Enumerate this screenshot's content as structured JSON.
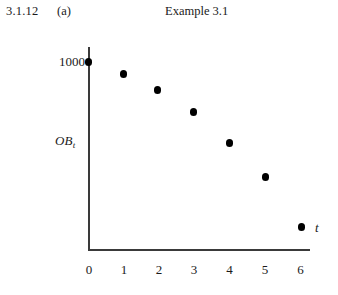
{
  "header": {
    "figure_number": "3.1.12",
    "figure_part": "(a)",
    "title": "Example 3.1"
  },
  "chart_data": {
    "type": "scatter",
    "title": "Example 3.1",
    "xlabel": "t",
    "ylabel": "OB_t",
    "ylabel_base": "OB",
    "ylabel_sub": "t",
    "x": [
      0,
      1,
      2,
      3,
      4,
      5,
      6
    ],
    "values": [
      1000,
      936,
      851,
      734,
      569,
      388,
      122
    ],
    "xtick_labels": [
      "0",
      "1",
      "2",
      "3",
      "4",
      "5",
      "6"
    ],
    "ytick_labels": [
      "1000"
    ],
    "ytick_values": [
      1000
    ],
    "xlim": [
      0,
      6.3
    ],
    "ylim": [
      0,
      1075
    ],
    "grid": false,
    "legend": false,
    "marker": "filled-circle",
    "marker_color": "#000000",
    "axis_color": "#3a3a3a"
  },
  "points": [
    {
      "label": "t0",
      "x_px": 88.5,
      "y_px": 62
    },
    {
      "label": "t1",
      "x_px": 123.5,
      "y_px": 74
    },
    {
      "label": "t2",
      "x_px": 157.5,
      "y_px": 90
    },
    {
      "label": "t3",
      "x_px": 193.5,
      "y_px": 112
    },
    {
      "label": "t4",
      "x_px": 229.5,
      "y_px": 143
    },
    {
      "label": "t5",
      "x_px": 265.5,
      "y_px": 177
    },
    {
      "label": "t6",
      "x_px": 301.5,
      "y_px": 227
    }
  ],
  "xticks": [
    {
      "label": "0",
      "x_px": 89
    },
    {
      "label": "1",
      "x_px": 124
    },
    {
      "label": "2",
      "x_px": 159
    },
    {
      "label": "3",
      "x_px": 194
    },
    {
      "label": "4",
      "x_px": 229.5
    },
    {
      "label": "5",
      "x_px": 265
    },
    {
      "label": "6",
      "x_px": 300.5
    }
  ],
  "yticks": [
    {
      "label": "1000",
      "y_px": 62,
      "right_px": 253
    }
  ],
  "axis_label_positions": {
    "y_left_px": 55,
    "y_top_px": 141,
    "x_left_px": 315,
    "x_top_px": 228
  }
}
